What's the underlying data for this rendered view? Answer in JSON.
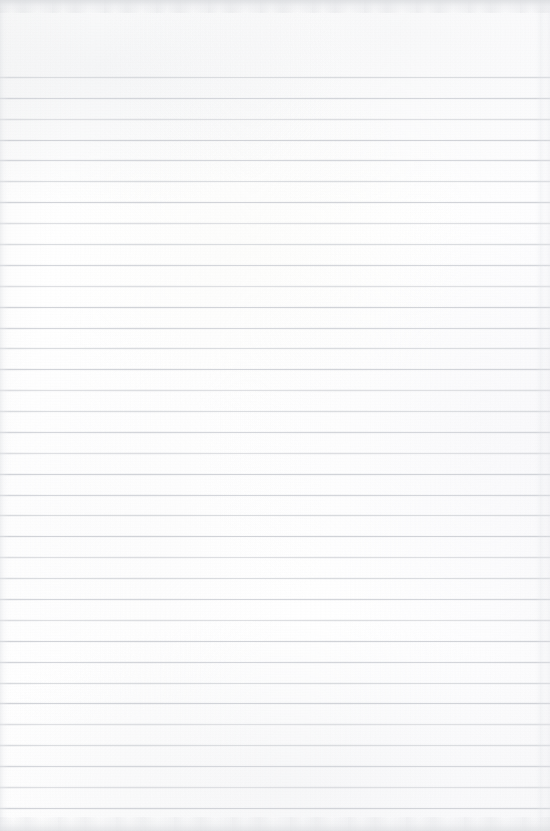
{
  "document": {
    "kind": "scanned-lined-paper",
    "title": "Blank ruled notebook page",
    "width_px": 550,
    "height_px": 831,
    "text_content": "",
    "handwriting_present": false,
    "printed_text_present": false
  },
  "paper": {
    "background_color": "#fdfdfd",
    "base_color": "#ffffff",
    "texture": "scanned paper with uneven illumination"
  },
  "ruling": {
    "type": "horizontal-ruled",
    "line_color": "#d9dbdf",
    "line_thickness_px": 1,
    "line_spacing_px": 20.9,
    "first_line_y_px": 77,
    "last_line_y_px": 808,
    "line_count": 36,
    "full_bleed": true,
    "left_margin_rule": false,
    "vertical_margin_line": false,
    "line_y_positions": [
      77,
      98,
      119,
      140,
      160,
      181,
      202,
      223,
      244,
      265,
      286,
      307,
      328,
      348,
      369,
      390,
      411,
      432,
      453,
      474,
      495,
      515,
      536,
      557,
      578,
      599,
      620,
      641,
      662,
      683,
      703,
      724,
      745,
      766,
      787,
      808
    ],
    "line_tone_variants": [
      "v1",
      "v2",
      "v3",
      "v4",
      "v2",
      "v1",
      "v4",
      "v3"
    ]
  },
  "margins": {
    "top_unruled_px": 77,
    "bottom_unruled_px": 23,
    "left_px": 0,
    "right_px": 0
  },
  "scan_artifacts": {
    "top_edge_shadow": true,
    "bottom_edge_shadow": true,
    "left_edge_streak": true,
    "right_edge_streak_x_px": 536,
    "edge_shadow_color": "#dbdde0",
    "grain": "fine"
  }
}
